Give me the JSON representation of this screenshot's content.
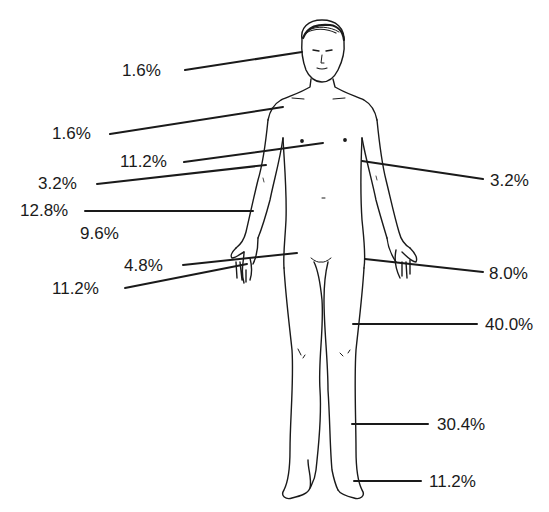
{
  "diagram": {
    "labels": [
      {
        "id": "head",
        "text": "1.6%",
        "x": 122,
        "y": 62,
        "side": "left"
      },
      {
        "id": "shoulder",
        "text": "1.6%",
        "x": 52,
        "y": 125,
        "side": "left"
      },
      {
        "id": "chest",
        "text": "11.2%",
        "x": 120,
        "y": 153,
        "side": "left"
      },
      {
        "id": "upper-arm-left",
        "text": "3.2%",
        "x": 38,
        "y": 175,
        "side": "left"
      },
      {
        "id": "forearm-left",
        "text": "12.8%",
        "x": 20,
        "y": 202,
        "side": "left"
      },
      {
        "id": "abdomen",
        "text": "9.6%",
        "x": 80,
        "y": 225,
        "side": "left"
      },
      {
        "id": "wrist-left",
        "text": "4.8%",
        "x": 124,
        "y": 257,
        "side": "left"
      },
      {
        "id": "hand-left",
        "text": "11.2%",
        "x": 52,
        "y": 280,
        "side": "left"
      },
      {
        "id": "upper-arm-right",
        "text": "3.2%",
        "x": 490,
        "y": 172,
        "side": "right"
      },
      {
        "id": "hand-right",
        "text": "8.0%",
        "x": 489,
        "y": 265,
        "side": "right"
      },
      {
        "id": "thigh",
        "text": "40.0%",
        "x": 485,
        "y": 316,
        "side": "right"
      },
      {
        "id": "shin",
        "text": "30.4%",
        "x": 437,
        "y": 416,
        "side": "right"
      },
      {
        "id": "foot",
        "text": "11.2%",
        "x": 429,
        "y": 473,
        "side": "right"
      }
    ],
    "leaders": [
      {
        "x1": 185,
        "y1": 70,
        "x2": 302,
        "y2": 52
      },
      {
        "x1": 110,
        "y1": 134,
        "x2": 283,
        "y2": 107
      },
      {
        "x1": 184,
        "y1": 162,
        "x2": 323,
        "y2": 143
      },
      {
        "x1": 97,
        "y1": 184,
        "x2": 266,
        "y2": 165
      },
      {
        "x1": 85,
        "y1": 211,
        "x2": 253,
        "y2": 211
      },
      {
        "x1": 183,
        "y1": 265,
        "x2": 297,
        "y2": 253
      },
      {
        "x1": 125,
        "y1": 288,
        "x2": 247,
        "y2": 264
      },
      {
        "x1": 362,
        "y1": 161,
        "x2": 483,
        "y2": 179
      },
      {
        "x1": 365,
        "y1": 259,
        "x2": 483,
        "y2": 272
      },
      {
        "x1": 353,
        "y1": 324,
        "x2": 477,
        "y2": 324
      },
      {
        "x1": 352,
        "y1": 424,
        "x2": 428,
        "y2": 424
      },
      {
        "x1": 354,
        "y1": 481,
        "x2": 421,
        "y2": 481
      }
    ],
    "colors": {
      "line": "#1a1a1a",
      "text": "#1a1a1a",
      "background": "#ffffff"
    }
  }
}
